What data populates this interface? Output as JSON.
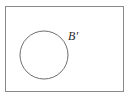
{
  "figure": {
    "kind": "set-diagram",
    "background_color": "#ffffff",
    "canvas": {
      "width": 132,
      "height": 101
    },
    "universal_set_rectangle": {
      "name": "universal-set",
      "x": 5,
      "y": 6,
      "width": 119,
      "height": 86,
      "stroke_color": "#8a8a8a",
      "stroke_width": 1,
      "fill": "none"
    },
    "circle": {
      "name": "set-b",
      "cx": 44,
      "cy": 55,
      "r": 24,
      "stroke_color": "#6e6e6e",
      "stroke_width": 1,
      "fill": "none"
    },
    "labels": [
      {
        "name": "b-complement",
        "text": "B′",
        "x": 68,
        "y": 30,
        "color": "#2b2b2b",
        "font_size": 12,
        "font_style": "italic"
      }
    ]
  }
}
